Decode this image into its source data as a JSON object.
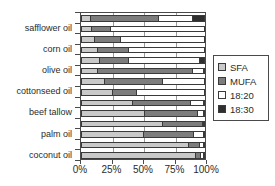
{
  "chart_data": {
    "type": "bar",
    "orientation": "horizontal",
    "stacked": true,
    "stack_mode": "percent",
    "title": "",
    "xlabel": "",
    "ylabel": "",
    "xlim": [
      0,
      100
    ],
    "xticks": [
      0,
      25,
      50,
      75,
      100
    ],
    "xticklabels": [
      "0%",
      "25%",
      "50%",
      "75%",
      "100%"
    ],
    "grid": true,
    "grid_axis": "x",
    "legend_position": "right",
    "categories": [
      "safflower oil",
      "corn oil",
      "olive oil",
      "cottonseed oil",
      "beef tallow",
      "palm oil",
      "coconut oil"
    ],
    "series": [
      {
        "name": "SFA",
        "color": "#c9c9c9"
      },
      {
        "name": "MUFA",
        "color": "#7d7d7d"
      },
      {
        "name": "18:20",
        "color": "#ffffff"
      },
      {
        "name": "18:30",
        "color": "#2f2f2f"
      }
    ],
    "bars": [
      {
        "label": "",
        "values": [
          8,
          55,
          27,
          10
        ]
      },
      {
        "label": "safflower oil",
        "values": [
          9,
          15,
          76,
          0
        ]
      },
      {
        "label": "",
        "values": [
          11,
          21,
          68,
          0
        ]
      },
      {
        "label": "corn oil",
        "values": [
          14,
          25,
          61,
          0
        ]
      },
      {
        "label": "",
        "values": [
          15,
          24,
          57,
          4
        ]
      },
      {
        "label": "olive oil",
        "values": [
          14,
          76,
          9,
          1
        ]
      },
      {
        "label": "",
        "values": [
          19,
          47,
          34,
          0
        ]
      },
      {
        "label": "cottonseed oil",
        "values": [
          26,
          19,
          55,
          0
        ]
      },
      {
        "label": "",
        "values": [
          42,
          47,
          10,
          1
        ]
      },
      {
        "label": "beef tallow",
        "values": [
          52,
          42,
          5,
          1
        ]
      },
      {
        "label": "",
        "values": [
          66,
          32,
          1,
          1
        ]
      },
      {
        "label": "palm oil",
        "values": [
          51,
          40,
          8,
          1
        ]
      },
      {
        "label": "",
        "values": [
          87,
          9,
          3,
          1
        ]
      },
      {
        "label": "coconut oil",
        "values": [
          93,
          4,
          2,
          1
        ]
      }
    ]
  },
  "legend": {
    "items": [
      {
        "label": "SFA"
      },
      {
        "label": "MUFA"
      },
      {
        "label": "18:20"
      },
      {
        "label": "18:30"
      }
    ]
  },
  "axis": {
    "x_tick_labels": [
      "0%",
      "25%",
      "50%",
      "75%",
      "100%"
    ]
  },
  "colors": {
    "sfa": "#c9c9c9",
    "mufa": "#7d7d7d",
    "c1820": "#ffffff",
    "c1830": "#2f2f2f",
    "axis": "#4a4a4a",
    "grid": "#9a9a9a",
    "text": "#2b2b2b"
  }
}
